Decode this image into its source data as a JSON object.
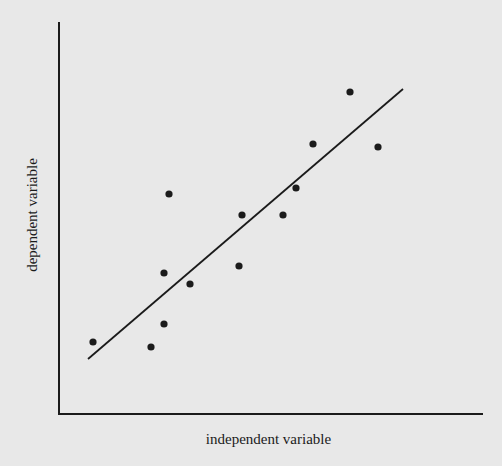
{
  "chart_data": {
    "type": "scatter",
    "title": "",
    "xlabel": "independent variable",
    "ylabel": "dependent variable",
    "xlim": [
      0,
      10
    ],
    "ylim": [
      0,
      10
    ],
    "grid": false,
    "legend": null,
    "ticks": {
      "x": [],
      "y": []
    },
    "points": [
      {
        "x": 0.8,
        "y": 1.8
      },
      {
        "x": 2.2,
        "y": 1.7
      },
      {
        "x": 2.5,
        "y": 2.3
      },
      {
        "x": 2.5,
        "y": 3.6
      },
      {
        "x": 2.6,
        "y": 5.6
      },
      {
        "x": 3.1,
        "y": 3.3
      },
      {
        "x": 4.2,
        "y": 3.8
      },
      {
        "x": 4.3,
        "y": 5.1
      },
      {
        "x": 5.3,
        "y": 5.1
      },
      {
        "x": 5.6,
        "y": 5.8
      },
      {
        "x": 6.0,
        "y": 6.9
      },
      {
        "x": 6.9,
        "y": 8.2
      },
      {
        "x": 7.5,
        "y": 6.8
      }
    ],
    "trend_line": {
      "type": "linear",
      "start": {
        "x": 0.7,
        "y": 1.4
      },
      "end": {
        "x": 8.1,
        "y": 8.3
      }
    },
    "pixel_geometry": {
      "origin": [
        59,
        414
      ],
      "x_axis_end": [
        483,
        414
      ],
      "y_axis_top": [
        59,
        22
      ],
      "line": [
        [
          88,
          359
        ],
        [
          403,
          89
        ]
      ],
      "points_px": [
        [
          93,
          342
        ],
        [
          151,
          347
        ],
        [
          164,
          324
        ],
        [
          164,
          273
        ],
        [
          169,
          194
        ],
        [
          190,
          284
        ],
        [
          239,
          266
        ],
        [
          242,
          215
        ],
        [
          283,
          215
        ],
        [
          296,
          188
        ],
        [
          313,
          144
        ],
        [
          350,
          92
        ],
        [
          378,
          147
        ]
      ]
    }
  },
  "colors": {
    "background": "#e8e8e8",
    "ink": "#1b1b1b"
  }
}
